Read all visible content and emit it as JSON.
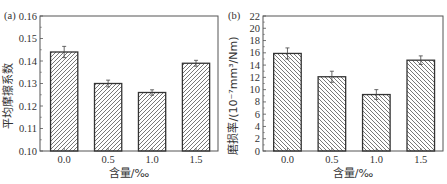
{
  "chart_data": [
    {
      "type": "bar",
      "panel": "(a)",
      "title": "",
      "xlabel": "含量/‰",
      "ylabel": "平均摩擦系数",
      "categories": [
        "0.0",
        "0.5",
        "1.0",
        "1.5"
      ],
      "values": [
        0.144,
        0.13,
        0.126,
        0.139
      ],
      "errors": [
        0.0025,
        0.0015,
        0.0012,
        0.0013
      ],
      "ylim": [
        0.1,
        0.16
      ],
      "yticks": [
        "0.10",
        "0.11",
        "0.12",
        "0.13",
        "0.14",
        "0.15",
        "0.16"
      ],
      "hatch": "forward-diagonal",
      "grid": false,
      "legend": null
    },
    {
      "type": "bar",
      "panel": "(b)",
      "title": "",
      "xlabel": "含量/‰",
      "ylabel": "磨损率/(10⁻⁷mm³/Nm)",
      "categories": [
        "0.0",
        "0.5",
        "1.0",
        "1.5"
      ],
      "values": [
        15.9,
        12.1,
        9.2,
        14.8
      ],
      "errors": [
        0.9,
        0.9,
        0.8,
        0.7
      ],
      "ylim": [
        0,
        22
      ],
      "yticks": [
        "0",
        "2",
        "4",
        "6",
        "8",
        "10",
        "12",
        "14",
        "16",
        "18",
        "20",
        "22"
      ],
      "hatch": "back-diagonal",
      "grid": false,
      "legend": null
    }
  ],
  "colors": {
    "axis": "#555555",
    "bar_edge": "#333333",
    "hatch": "#555555",
    "background": "#ffffff"
  }
}
